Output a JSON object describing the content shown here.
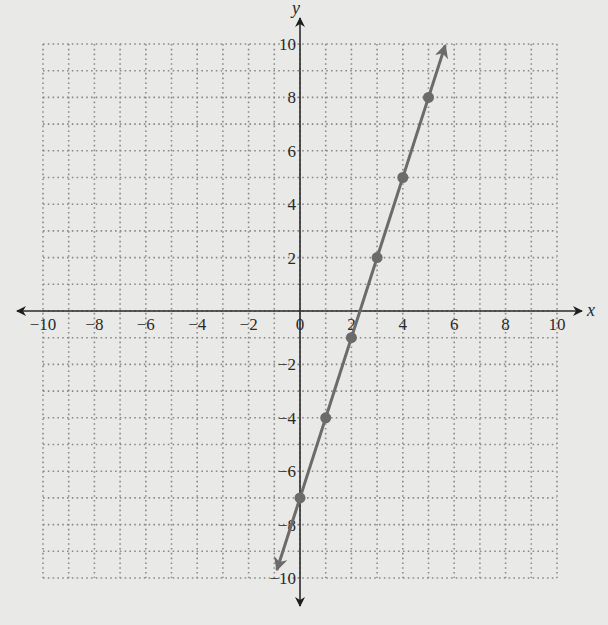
{
  "chart_data": {
    "type": "line",
    "title": "",
    "xlabel": "x",
    "ylabel": "y",
    "xlim": [
      -10,
      10
    ],
    "ylim": [
      -10,
      10
    ],
    "grid": true,
    "grid_step": 1,
    "grid_style": "dotted",
    "x_ticks": [
      -10,
      -8,
      -6,
      -4,
      -2,
      0,
      2,
      4,
      6,
      8,
      10
    ],
    "y_ticks": [
      -10,
      -8,
      -6,
      -4,
      -2,
      2,
      4,
      6,
      8,
      10
    ],
    "x_tick_labels": [
      "−10",
      "−8",
      "−6",
      "−4",
      "−2",
      "0",
      "2",
      "4",
      "6",
      "8",
      "10"
    ],
    "y_tick_labels": [
      "−10",
      "−8",
      "−6",
      "−4",
      "−2",
      "2",
      "4",
      "6",
      "8",
      "10"
    ],
    "series": [
      {
        "name": "y = 3x − 7",
        "equation": "y = 3x - 7",
        "line_start": [
          -0.9,
          -9.7
        ],
        "line_end": [
          5.65,
          9.95
        ],
        "arrows_both_ends": true,
        "points": [
          [
            0,
            -7
          ],
          [
            1,
            -4
          ],
          [
            2,
            -1
          ],
          [
            3,
            2
          ],
          [
            4,
            5
          ],
          [
            5,
            8
          ]
        ]
      }
    ],
    "colors": {
      "background": "#e9e9e8",
      "axis": "#2a2a2a",
      "grid": "#8a8a8a",
      "line": "#6b6b6b",
      "points": "#6b6b6b"
    }
  }
}
